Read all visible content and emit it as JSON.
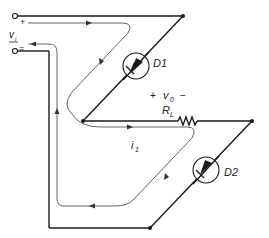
{
  "diagram": {
    "type": "circuit",
    "colors": {
      "wire": "#1a1a1a",
      "current_path": "#555555",
      "background": "#ffffff"
    },
    "input": {
      "label": "v",
      "subscript": "i",
      "plus": "+",
      "minus": "="
    },
    "components": [
      {
        "id": "D1",
        "type": "diode",
        "label": "D1"
      },
      {
        "id": "D2",
        "type": "diode",
        "label": "D2"
      },
      {
        "id": "RL",
        "type": "resistor",
        "label": "R",
        "subscript": "L"
      }
    ],
    "output": {
      "plus": "+",
      "label": "v",
      "subscript": "0",
      "minus": "−"
    },
    "current": {
      "label": "i",
      "subscript": "1"
    }
  }
}
